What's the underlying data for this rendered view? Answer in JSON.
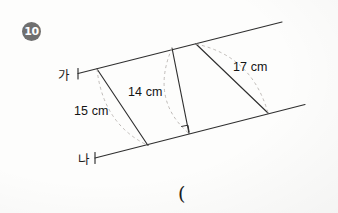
{
  "page": {
    "background_color": "#fdfdfc",
    "width": 338,
    "height": 213
  },
  "problem": {
    "number": "10",
    "answer_prompt": "("
  },
  "figure": {
    "type": "parallel-lines-with-transversals",
    "stroke_color": "#2a2a2a",
    "dashed_arc_color": "#b5b0ad",
    "lines": [
      {
        "name": "line-ga",
        "label": "가",
        "role": "upper parallel line"
      },
      {
        "name": "line-na",
        "label": "나",
        "role": "lower parallel line"
      }
    ],
    "segments": [
      {
        "name": "segment-15",
        "label": "15 cm",
        "value": 15,
        "unit": "cm",
        "perpendicular": false
      },
      {
        "name": "segment-14",
        "label": "14 cm",
        "value": 14,
        "unit": "cm",
        "perpendicular": true
      },
      {
        "name": "segment-17",
        "label": "17 cm",
        "value": 17,
        "unit": "cm",
        "perpendicular": false
      }
    ],
    "right_angle_marks": 1,
    "dashed_arcs": 3
  }
}
